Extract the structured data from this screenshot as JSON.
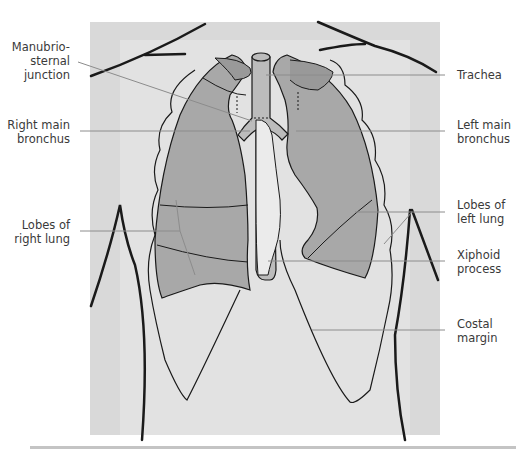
{
  "figure": {
    "type": "anatomical illustration",
    "colors": {
      "background_panel": "#d6d6d6",
      "torso_light": "#e8e8e8",
      "lung_fill": "#a9a9a9",
      "outline": "#1a1a1a",
      "leader_line": "#8c8c8c",
      "label_text": "#3a3a3a"
    }
  },
  "labels": {
    "left": [
      {
        "id": "manubriosternal",
        "lines": [
          "Manubrio-",
          "sternal",
          "junction"
        ]
      },
      {
        "id": "right-main-bronchus",
        "lines": [
          "Right main",
          "bronchus"
        ]
      },
      {
        "id": "lobes-right-lung",
        "lines": [
          "Lobes of",
          "right lung"
        ]
      }
    ],
    "right": [
      {
        "id": "trachea",
        "lines": [
          "Trachea"
        ]
      },
      {
        "id": "left-main-bronchus",
        "lines": [
          "Left main",
          "bronchus"
        ]
      },
      {
        "id": "lobes-left-lung",
        "lines": [
          "Lobes of",
          "left lung"
        ]
      },
      {
        "id": "xiphoid",
        "lines": [
          "Xiphoid",
          "process"
        ]
      },
      {
        "id": "costal-margin",
        "lines": [
          "Costal",
          "margin"
        ]
      }
    ]
  }
}
